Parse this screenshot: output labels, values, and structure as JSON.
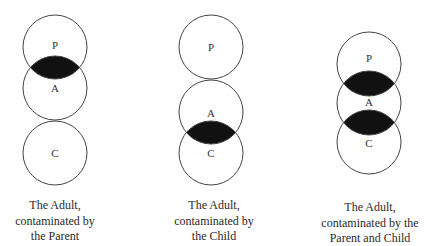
{
  "diagrams": [
    {
      "id": "parent-contamination",
      "labels": {
        "parent": "P",
        "adult": "A",
        "child": "C"
      },
      "caption": [
        "The Adult,",
        "contaminated by",
        "the Parent"
      ],
      "contaminated_overlaps": [
        "P-A"
      ]
    },
    {
      "id": "child-contamination",
      "labels": {
        "parent": "P",
        "adult": "A",
        "child": "C"
      },
      "caption": [
        "The Adult,",
        "contaminated by",
        "the Child"
      ],
      "contaminated_overlaps": [
        "A-C"
      ]
    },
    {
      "id": "double-contamination",
      "labels": {
        "parent": "P",
        "adult": "A",
        "child": "C"
      },
      "caption": [
        "The Adult,",
        "contaminated by the",
        "Parent and Child"
      ],
      "contaminated_overlaps": [
        "P-A",
        "A-C"
      ]
    }
  ],
  "colors": {
    "stroke": "#444444",
    "contamination_fill": "#111111",
    "background": "#ffffff"
  }
}
